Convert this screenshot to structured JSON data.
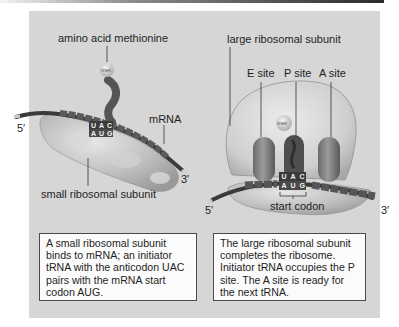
{
  "figure": {
    "colors": {
      "panel_bg": "#d6d6d6",
      "caption_bg": "#fbfbfb",
      "caption_border": "#4a4a4a",
      "ribosome": "#c4c4c4",
      "trna": "#595959",
      "mrna": "#3f3f3f"
    },
    "left_panel": {
      "label_amino_acid": "amino acid methionine",
      "met_label": "met",
      "anticodon": [
        "U",
        "A",
        "C"
      ],
      "codon": [
        "A",
        "U",
        "G"
      ],
      "label_mrna": "mRNA",
      "label_5prime": "5′",
      "label_3prime": "3′",
      "label_small_subunit": "small ribosomal subunit",
      "caption": "A small ribosomal subunit binds to mRNA; an initiator tRNA with the anticodon UAC pairs with the mRNA start codon AUG."
    },
    "right_panel": {
      "label_large_subunit": "large ribosomal subunit",
      "label_e_site": "E site",
      "label_p_site": "P site",
      "label_a_site": "A site",
      "met_label": "met",
      "anticodon": [
        "U",
        "A",
        "C"
      ],
      "codon": [
        "A",
        "U",
        "G"
      ],
      "label_start_codon": "start codon",
      "label_5prime": "5′",
      "label_3prime": "3′",
      "caption": "The large ribosomal subunit completes the ribosome. Initiator tRNA occupies the P site. The A site is ready for the next tRNA."
    }
  }
}
